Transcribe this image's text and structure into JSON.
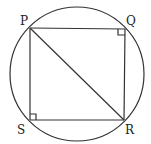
{
  "diagram": {
    "type": "geometry",
    "circle": {
      "cx": 77,
      "cy": 74,
      "r": 67
    },
    "points": {
      "P": {
        "label": "P",
        "x": 30,
        "y": 28
      },
      "Q": {
        "label": "Q",
        "x": 125,
        "y": 29
      },
      "R": {
        "label": "R",
        "x": 124,
        "y": 120
      },
      "S": {
        "label": "S",
        "x": 30,
        "y": 120
      }
    },
    "segments": [
      "PQ",
      "QR",
      "RS",
      "SP",
      "PR"
    ],
    "right_angles": [
      "Q",
      "S"
    ]
  }
}
